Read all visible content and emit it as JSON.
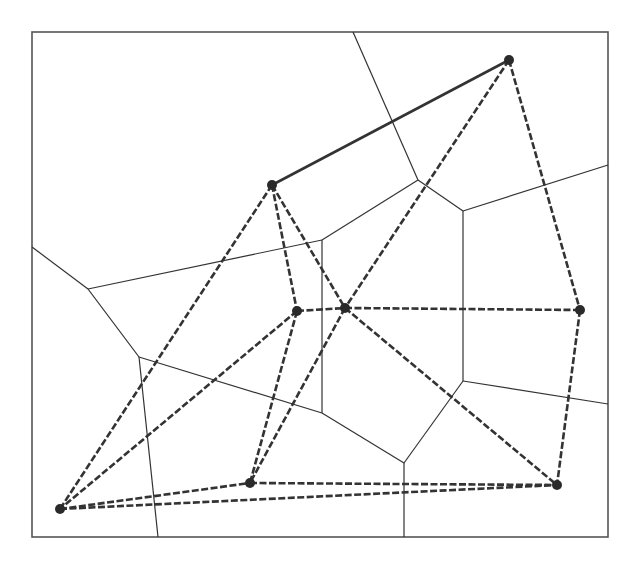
{
  "diagram": {
    "type": "voronoi-delaunay",
    "frame": {
      "x": 32,
      "y": 32,
      "width": 576,
      "height": 505
    },
    "colors": {
      "background": "#ffffff",
      "line": "#333333",
      "node": "#2a2a2a",
      "frame": "#555555"
    },
    "nodes": [
      {
        "id": "A",
        "x": 272,
        "y": 185
      },
      {
        "id": "B",
        "x": 509,
        "y": 60
      },
      {
        "id": "C",
        "x": 297,
        "y": 311
      },
      {
        "id": "D",
        "x": 345,
        "y": 308
      },
      {
        "id": "E",
        "x": 580,
        "y": 310
      },
      {
        "id": "F",
        "x": 60,
        "y": 509
      },
      {
        "id": "G",
        "x": 250,
        "y": 483
      },
      {
        "id": "H",
        "x": 557,
        "y": 485
      }
    ],
    "delaunay_edges": [
      {
        "from": "A",
        "to": "B",
        "style": "solid"
      },
      {
        "from": "A",
        "to": "F",
        "style": "dashed"
      },
      {
        "from": "A",
        "to": "C",
        "style": "dashed"
      },
      {
        "from": "A",
        "to": "D",
        "style": "dashed"
      },
      {
        "from": "B",
        "to": "D",
        "style": "dashed"
      },
      {
        "from": "B",
        "to": "E",
        "style": "dashed"
      },
      {
        "from": "C",
        "to": "D",
        "style": "dashed"
      },
      {
        "from": "C",
        "to": "F",
        "style": "dashed"
      },
      {
        "from": "C",
        "to": "G",
        "style": "dashed"
      },
      {
        "from": "D",
        "to": "E",
        "style": "dashed"
      },
      {
        "from": "D",
        "to": "G",
        "style": "dashed"
      },
      {
        "from": "D",
        "to": "H",
        "style": "dashed"
      },
      {
        "from": "E",
        "to": "H",
        "style": "dashed"
      },
      {
        "from": "F",
        "to": "G",
        "style": "dashed"
      },
      {
        "from": "F",
        "to": "H",
        "style": "dashed"
      },
      {
        "from": "G",
        "to": "H",
        "style": "dashed"
      }
    ],
    "voronoi_edges": [
      [
        [
          32,
          247
        ],
        [
          88,
          289
        ]
      ],
      [
        [
          88,
          289
        ],
        [
          322,
          240
        ]
      ],
      [
        [
          88,
          289
        ],
        [
          139,
          357
        ]
      ],
      [
        [
          139,
          357
        ],
        [
          158,
          537
        ]
      ],
      [
        [
          139,
          357
        ],
        [
          322,
          413
        ]
      ],
      [
        [
          322,
          240
        ],
        [
          418,
          180
        ]
      ],
      [
        [
          322,
          240
        ],
        [
          322,
          413
        ]
      ],
      [
        [
          353,
          32
        ],
        [
          418,
          180
        ]
      ],
      [
        [
          418,
          180
        ],
        [
          463,
          211
        ]
      ],
      [
        [
          463,
          211
        ],
        [
          608,
          165
        ]
      ],
      [
        [
          463,
          211
        ],
        [
          463,
          381
        ]
      ],
      [
        [
          463,
          381
        ],
        [
          608,
          404
        ]
      ],
      [
        [
          463,
          381
        ],
        [
          404,
          463
        ]
      ],
      [
        [
          322,
          413
        ],
        [
          404,
          463
        ]
      ],
      [
        [
          404,
          463
        ],
        [
          404,
          537
        ]
      ]
    ]
  }
}
